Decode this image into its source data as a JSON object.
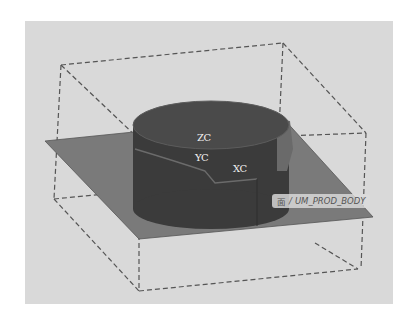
{
  "viewport": {
    "background": "#d9d9d9",
    "axes": {
      "z_label": "ZC",
      "y_label": "YC",
      "x_label": "XC"
    },
    "tooltip": {
      "icon": "面",
      "separator": "/",
      "text": "UM_PROD_BODY"
    },
    "colors": {
      "plane": "#7a7a7a",
      "cylinder_top": "#4a4a4a",
      "cylinder_side": "#3b3b3b",
      "bounding_box": "#555555"
    }
  }
}
